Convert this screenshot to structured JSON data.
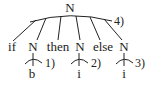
{
  "diagram": {
    "type": "parse-tree",
    "root": {
      "label": "N",
      "annotation": "4)",
      "children": [
        {
          "label": "if"
        },
        {
          "label": "N",
          "annotation": "1)",
          "children": [
            {
              "label": "b"
            }
          ]
        },
        {
          "label": "then"
        },
        {
          "label": "N",
          "annotation": "2)",
          "children": [
            {
              "label": "i"
            }
          ]
        },
        {
          "label": "else"
        },
        {
          "label": "N",
          "annotation": "3)",
          "children": [
            {
              "label": "i"
            }
          ]
        }
      ]
    },
    "labels": {
      "root": "N",
      "root_annotation": "4)",
      "c0": "if",
      "c1": "N",
      "c1_leaf": "b",
      "c1_annotation": "1)",
      "c2": "then",
      "c3": "N",
      "c3_leaf": "i",
      "c3_annotation": "2)",
      "c4": "else",
      "c5": "N",
      "c5_leaf": "i",
      "c5_annotation": "3)"
    },
    "colors": {
      "ink": "#222222",
      "background": "#ffffff"
    }
  }
}
